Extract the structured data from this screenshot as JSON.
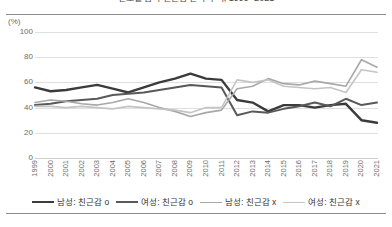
{
  "title": "연도별 남녀 친근감 인식 추이, 1999~2021",
  "axis": {
    "unit_label": "(%)",
    "y_ticks": [
      "100",
      "80",
      "60",
      "40",
      "20",
      "0"
    ],
    "x_ticks": [
      "1999",
      "2000",
      "2001",
      "2002",
      "2003",
      "2004",
      "2005",
      "2006",
      "2007",
      "2008",
      "2009",
      "2010",
      "2011",
      "2012",
      "2013",
      "2014",
      "2015",
      "2016",
      "2017",
      "2018",
      "2019",
      "2020",
      "2021"
    ]
  },
  "legend": {
    "items": [
      {
        "label": "남성: 친근감 o",
        "color": "#3b3b3b",
        "width": 2.4
      },
      {
        "label": "여성: 친근감 o",
        "color": "#595959",
        "width": 2.0
      },
      {
        "label": "남성: 친근감 x",
        "color": "#a8a8a8",
        "width": 1.6
      },
      {
        "label": "여성: 친근감 x",
        "color": "#c4c4c4",
        "width": 1.6
      }
    ]
  },
  "chart_data": {
    "type": "line",
    "title": "연도별 남녀 친근감 인식 추이, 1999~2021",
    "xlabel": "",
    "ylabel": "(%)",
    "ylim": [
      0,
      100
    ],
    "xlim_categories": [
      "1999",
      "2000",
      "2001",
      "2002",
      "2003",
      "2004",
      "2005",
      "2006",
      "2007",
      "2008",
      "2009",
      "2010",
      "2011",
      "2012",
      "2013",
      "2014",
      "2015",
      "2016",
      "2017",
      "2018",
      "2019",
      "2020",
      "2021"
    ],
    "grid": true,
    "legend_position": "bottom",
    "series": [
      {
        "name": "남성: 친근감 o",
        "color": "#3b3b3b",
        "values": [
          56,
          53,
          54,
          56,
          58,
          55,
          52,
          56,
          60,
          63,
          67,
          63,
          62,
          46,
          44,
          37,
          42,
          42,
          40,
          42,
          43,
          30,
          28
        ]
      },
      {
        "name": "여성: 친근감 o",
        "color": "#595959",
        "values": [
          42,
          43,
          45,
          46,
          47,
          50,
          51,
          52,
          54,
          56,
          58,
          57,
          56,
          34,
          37,
          36,
          39,
          41,
          44,
          41,
          47,
          42,
          44
        ]
      },
      {
        "name": "남성: 친근감 x",
        "color": "#a8a8a8",
        "values": [
          44,
          46,
          45,
          43,
          42,
          44,
          47,
          44,
          40,
          37,
          33,
          36,
          38,
          55,
          57,
          63,
          59,
          58,
          61,
          59,
          57,
          78,
          72
        ]
      },
      {
        "name": "여성: 친근감 x",
        "color": "#c4c4c4",
        "values": [
          41,
          41,
          40,
          41,
          40,
          39,
          41,
          40,
          39,
          38,
          36,
          40,
          40,
          62,
          60,
          62,
          57,
          56,
          55,
          56,
          52,
          70,
          68
        ]
      }
    ]
  }
}
